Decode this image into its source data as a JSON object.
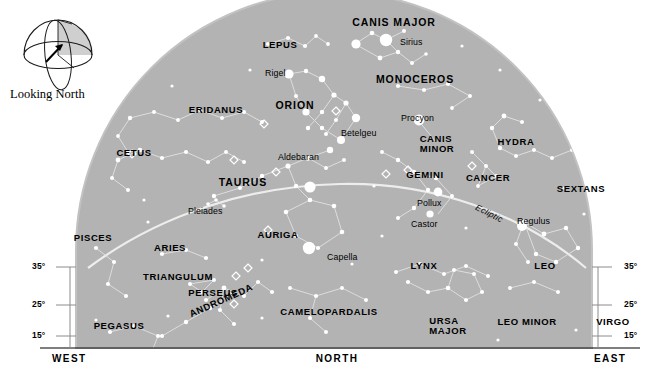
{
  "colors": {
    "sky": "#b3b3b3",
    "sky_edge": "#c9c9c9",
    "background": "#ffffff",
    "star": "#ffffff",
    "line": "#e6e6e6",
    "text": "#000000",
    "compass_shade": "#cccccc",
    "tick": "#9a9a9a"
  },
  "compass": {
    "caption": "Looking North",
    "icon": "hemisphere-dome-icon",
    "arrow": "north-arrow-icon"
  },
  "directions": {
    "west": "WEST",
    "north": "NORTH",
    "east": "EAST"
  },
  "altitude_scale": {
    "unit": "°",
    "left": [
      "35°",
      "25°",
      "15°"
    ],
    "right": [
      "35°",
      "25°",
      "15°"
    ]
  },
  "ecliptic_label": "Ecliptic",
  "constellations": [
    {
      "name": "LEPUS",
      "x": 280,
      "y": 40,
      "size": "normal"
    },
    {
      "name": "CANIS MAJOR",
      "x": 394,
      "y": 17,
      "size": "big"
    },
    {
      "name": "MONOCEROS",
      "x": 415,
      "y": 74,
      "size": "big"
    },
    {
      "name": "ERIDANUS",
      "x": 216,
      "y": 105,
      "size": "normal"
    },
    {
      "name": "ORION",
      "x": 295,
      "y": 100,
      "size": "big"
    },
    {
      "name": "CETUS",
      "x": 134,
      "y": 148,
      "size": "normal"
    },
    {
      "name": "TAURUS",
      "x": 243,
      "y": 177,
      "size": "big"
    },
    {
      "name": "GEMINI",
      "x": 425,
      "y": 170,
      "size": "normal"
    },
    {
      "name": "CANCER",
      "x": 488,
      "y": 173,
      "size": "normal"
    },
    {
      "name": "HYDRA",
      "x": 516,
      "y": 137,
      "size": "normal"
    },
    {
      "name": "SEXTANS",
      "x": 581,
      "y": 184,
      "size": "normal"
    },
    {
      "name": "PISCES",
      "x": 93,
      "y": 233,
      "size": "normal"
    },
    {
      "name": "ARIES",
      "x": 170,
      "y": 243,
      "size": "normal"
    },
    {
      "name": "AURIGA",
      "x": 278,
      "y": 230,
      "size": "normal"
    },
    {
      "name": "LYNX",
      "x": 424,
      "y": 261,
      "size": "normal"
    },
    {
      "name": "LEO",
      "x": 545,
      "y": 261,
      "size": "normal"
    },
    {
      "name": "TRIANGULUM",
      "x": 178,
      "y": 272,
      "size": "normal"
    },
    {
      "name": "PERSEUS",
      "x": 213,
      "y": 288,
      "size": "normal"
    },
    {
      "name": "PEGASUS",
      "x": 119,
      "y": 321,
      "size": "normal"
    },
    {
      "name": "CAMELOPARDALIS",
      "x": 329,
      "y": 307,
      "size": "normal"
    },
    {
      "name": "LEO MINOR",
      "x": 527,
      "y": 317,
      "size": "normal"
    },
    {
      "name": "VIRGO",
      "x": 613,
      "y": 317,
      "size": "normal"
    }
  ],
  "constellations_rotated": [
    {
      "name": "ANDROMEDA",
      "x": 188,
      "y": 310,
      "rotate": -24
    }
  ],
  "constellations_stacked": [
    {
      "lines": [
        "CANIS",
        "MINOR"
      ],
      "x": 437,
      "y": 134
    },
    {
      "lines": [
        "URSA",
        "MAJOR"
      ],
      "x": 448,
      "y": 316
    }
  ],
  "stars_named": [
    {
      "name": "Sirius",
      "x": 400,
      "y": 38
    },
    {
      "name": "Rigel",
      "x": 265,
      "y": 69
    },
    {
      "name": "Procyon",
      "x": 401,
      "y": 114
    },
    {
      "name": "Betelgeu",
      "x": 341,
      "y": 129
    },
    {
      "name": "Aldebaran",
      "x": 278,
      "y": 153
    },
    {
      "name": "Pleiades",
      "x": 188,
      "y": 207
    },
    {
      "name": "Pollux",
      "x": 417,
      "y": 199
    },
    {
      "name": "Castor",
      "x": 411,
      "y": 220
    },
    {
      "name": "Regulus",
      "x": 517,
      "y": 217
    },
    {
      "name": "Capella",
      "x": 327,
      "y": 253
    }
  ],
  "chart_data": {
    "type": "scatter",
    "title": "Looking North",
    "projection": "horizon-dome",
    "xlabel": "Azimuth (WEST — NORTH — EAST)",
    "ylabel": "Altitude (degrees)",
    "ylim": [
      0,
      90
    ],
    "gridlines": [
      "15°",
      "25°",
      "35°"
    ],
    "annotations": [
      "Ecliptic"
    ]
  }
}
